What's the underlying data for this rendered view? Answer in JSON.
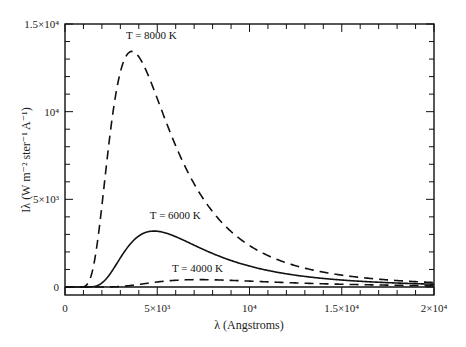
{
  "chart_data": {
    "type": "line",
    "title": "",
    "xlabel": "λ (Angstroms)",
    "ylabel": "Iλ (W m⁻² ster⁻¹ A⁻¹)",
    "xlim": [
      0,
      20000
    ],
    "ylim": [
      0,
      15000
    ],
    "grid": false,
    "legend": "none (inline curve labels)",
    "x_ticks": [
      {
        "value": 0,
        "label": "0"
      },
      {
        "value": 5000,
        "label": "5×10³"
      },
      {
        "value": 10000,
        "label": "10⁴"
      },
      {
        "value": 15000,
        "label": "1.5×10⁴"
      },
      {
        "value": 20000,
        "label": "2×10⁴"
      }
    ],
    "y_ticks": [
      {
        "value": 0,
        "label": "0"
      },
      {
        "value": 5000,
        "label": "5×10³"
      },
      {
        "value": 10000,
        "label": "10⁴"
      },
      {
        "value": 15000,
        "label": "1.5×10⁴"
      }
    ],
    "minor_tick_step_x": 1000,
    "minor_tick_step_y": 1000,
    "x": [
      1000,
      2000,
      3000,
      3600,
      4000,
      4800,
      5000,
      6000,
      7000,
      8000,
      10000,
      12000,
      15000,
      20000
    ],
    "series": [
      {
        "name": "T = 8000 K",
        "temperature_K": 8000,
        "style": "dashed",
        "values": [
          5,
          4680,
          12130,
          13390,
          13320,
          12230,
          11850,
          9700,
          7620,
          5900,
          3570,
          2230,
          1140,
          445
        ]
      },
      {
        "name": "T = 6000 K",
        "temperature_K": 6000,
        "style": "solid",
        "values": [
          0,
          330,
          1940,
          2800,
          3080,
          3180,
          3160,
          2880,
          2440,
          2020,
          1380,
          950,
          560,
          245
        ]
      },
      {
        "name": "T = 4000 K",
        "temperature_K": 4000,
        "style": "dashed",
        "values": [
          0,
          1,
          70,
          170,
          240,
          350,
          370,
          420,
          415,
          390,
          320,
          260,
          175,
          95
        ]
      }
    ],
    "annotations": [
      {
        "text": "T = 8000 K",
        "x": 3300,
        "y": 14150
      },
      {
        "text": "T = 6000 K",
        "x": 4600,
        "y": 3850
      },
      {
        "text": "T = 4000 K",
        "x": 5800,
        "y": 850
      }
    ]
  }
}
